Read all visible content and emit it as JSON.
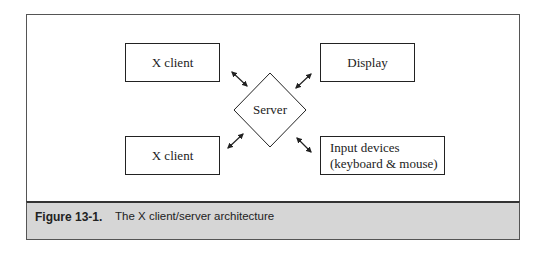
{
  "diagram": {
    "nodes": {
      "x_client_top": "X client",
      "display": "Display",
      "server": "Server",
      "x_client_bottom": "X client",
      "input_devices_line1": "Input devices",
      "input_devices_line2": "(keyboard & mouse)"
    },
    "edges": [
      {
        "from": "X client (top)",
        "to": "Server",
        "type": "bidirectional"
      },
      {
        "from": "Display",
        "to": "Server",
        "type": "bidirectional"
      },
      {
        "from": "X client (bottom)",
        "to": "Server",
        "type": "bidirectional"
      },
      {
        "from": "Input devices (keyboard & mouse)",
        "to": "Server",
        "type": "bidirectional"
      }
    ]
  },
  "caption": {
    "number": "Figure 13-1.",
    "text": "The X client/server architecture"
  }
}
